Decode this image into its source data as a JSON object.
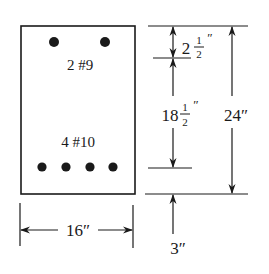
{
  "diagram": {
    "type": "reinforced-concrete-beam-cross-section",
    "colors": {
      "ink": "#1a1a1a",
      "background": "#ffffff"
    },
    "section": {
      "width_label": "16″",
      "height_label": "24″"
    },
    "top_reinforcement": {
      "label": "2 #9",
      "count": 2
    },
    "bottom_reinforcement": {
      "label": "4 #10",
      "count": 4
    },
    "dimensions": {
      "top_cover": {
        "whole": "2",
        "numerator": "1",
        "denominator": "2",
        "unit": "″"
      },
      "effective_spacing": {
        "whole": "18",
        "numerator": "1",
        "denominator": "2",
        "unit": "″"
      },
      "total_height": "24″",
      "width": "16″",
      "bottom_cover": "3″"
    }
  }
}
